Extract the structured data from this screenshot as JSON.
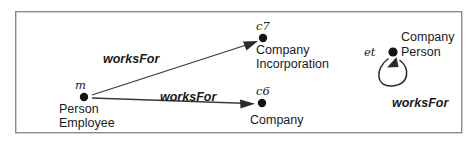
{
  "diagram": {
    "frame": {
      "x": 15,
      "y": 11,
      "width": 447,
      "height": 122,
      "stroke_color": "#8a8a8a"
    },
    "colors": {
      "node": "#141414",
      "edge": "#3a3a3a",
      "text": "#1a1a1a",
      "frame": "#8a8a8a"
    },
    "nodes": [
      {
        "key": "m",
        "id_label": "m",
        "id_x": 75,
        "id_y": 89,
        "dot_x": 84,
        "dot_y": 97,
        "dot_r": 4.2,
        "lines": [
          "Person",
          "Employee"
        ],
        "label_x": 59,
        "label_y": 113
      },
      {
        "key": "c7",
        "id_label": "c7",
        "id_x": 256,
        "id_y": 30,
        "dot_x": 263,
        "dot_y": 38,
        "dot_r": 4.2,
        "lines": [
          "Company",
          "Incorporation"
        ],
        "label_x": 256,
        "label_y": 54
      },
      {
        "key": "c6",
        "id_label": "c6",
        "id_x": 256,
        "id_y": 95,
        "dot_x": 262,
        "dot_y": 103,
        "dot_r": 4.2,
        "lines": [
          "Company"
        ],
        "label_x": 250,
        "label_y": 124
      },
      {
        "key": "et",
        "id_label": "et",
        "id_x": 364,
        "id_y": 56,
        "dot_x": 393,
        "dot_y": 52,
        "dot_r": 4.6,
        "lines": [
          "Company",
          "Person"
        ],
        "label_x": 401,
        "label_y": 41
      }
    ],
    "edges": [
      {
        "key": "m-to-c7",
        "label": "worksFor",
        "label_x": 103,
        "label_y": 63,
        "from": "m",
        "to": "c7",
        "x1": 92,
        "y1": 95,
        "x2": 255,
        "y2": 42
      },
      {
        "key": "m-to-c6",
        "label": "worksFor",
        "label_x": 160,
        "label_y": 101,
        "from": "m",
        "to": "c6",
        "x1": 92,
        "y1": 98,
        "x2": 253,
        "y2": 104
      },
      {
        "key": "et-self-loop",
        "label": "worksFor",
        "label_x": 392,
        "label_y": 107,
        "from": "et",
        "to": "et",
        "path": "M 390 58 C 375 68, 376 88, 392 86 C 409 84, 409 68, 398 61"
      }
    ]
  }
}
